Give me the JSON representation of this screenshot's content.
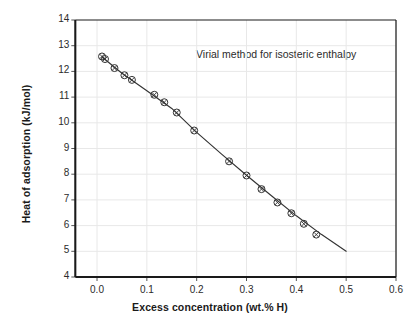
{
  "chart_data": {
    "type": "line",
    "title": "",
    "annotation": "Virial method for isosteric enthalpy",
    "xlabel": "Excess concentration  (wt.% H)",
    "ylabel": "Heat of adsorption  (kJ/mol)",
    "xlim": [
      -0.0436,
      0.6
    ],
    "ylim": [
      4,
      14
    ],
    "xticks": [
      0.0,
      0.1,
      0.2,
      0.3,
      0.4,
      0.5,
      0.6
    ],
    "xtick_labels": [
      "0.0",
      "0.1",
      "0.2",
      "0.3",
      "0.4",
      "0.5",
      "0.6"
    ],
    "yticks": [
      4,
      5,
      6,
      7,
      8,
      9,
      10,
      11,
      12,
      13,
      14
    ],
    "ytick_labels": [
      "4",
      "5",
      "6",
      "7",
      "8",
      "9",
      "10",
      "11",
      "12",
      "13",
      "14"
    ],
    "grid": true,
    "grid_color": "#e8e8e8",
    "line_color": "#333333",
    "marker": "circle-with-x",
    "marker_face": "#ffffff",
    "legend_position": "none",
    "x": [
      0.01,
      0.016,
      0.035,
      0.055,
      0.07,
      0.115,
      0.135,
      0.16,
      0.195,
      0.265,
      0.3,
      0.33,
      0.362,
      0.39,
      0.415,
      0.44
    ],
    "y": [
      12.58,
      12.48,
      12.13,
      11.85,
      11.67,
      11.09,
      10.8,
      10.4,
      9.7,
      8.5,
      7.95,
      7.42,
      6.9,
      6.48,
      6.07,
      5.65
    ],
    "fit_line": {
      "x": [
        0.01,
        0.05,
        0.1,
        0.15,
        0.2,
        0.25,
        0.3,
        0.35,
        0.4,
        0.45,
        0.5
      ],
      "y": [
        12.56,
        11.93,
        11.25,
        10.56,
        9.63,
        8.78,
        7.96,
        7.16,
        6.38,
        5.66,
        5.0
      ]
    }
  },
  "axes": {
    "frame_color": "#1a1a1a",
    "tick_color": "#555555"
  }
}
